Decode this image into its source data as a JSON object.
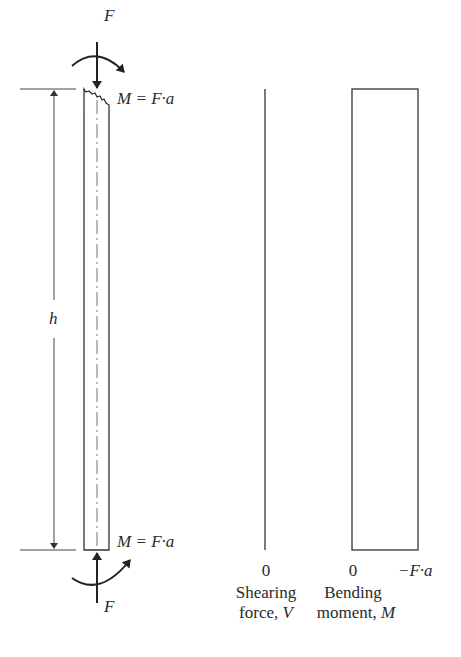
{
  "diagram": {
    "column": {
      "top_force_label": "F",
      "bottom_force_label": "F",
      "top_moment_label": "M = F·a",
      "bottom_moment_label": "M = F·a",
      "height_label": "h"
    },
    "shear_diagram": {
      "zero_label": "0",
      "title_line1": "Shearing",
      "title_line2_prefix": "force, ",
      "title_line2_symbol": "V"
    },
    "moment_diagram": {
      "zero_label": "0",
      "value_label": "−F·a",
      "title_line1": "Bending",
      "title_line2_prefix": "moment, ",
      "title_line2_symbol": "M"
    },
    "colors": {
      "line": "#333333",
      "background": "#ffffff"
    }
  }
}
